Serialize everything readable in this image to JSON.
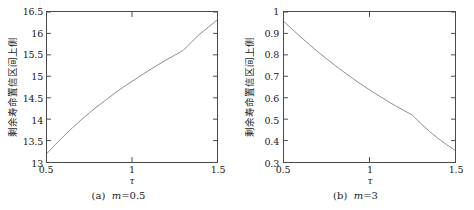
{
  "figure": {
    "panels": [
      {
        "id": "a",
        "caption_index": "(a)",
        "caption_var": "m",
        "caption_eq": "=0.5",
        "ylabel": "剩余寿命置信区间上侧",
        "xlabel": "τ",
        "xticks": [
          "0.5",
          "1",
          "1.5"
        ],
        "yticks": [
          "13",
          "13.5",
          "14",
          "14.5",
          "15",
          "15.5",
          "16",
          "16.5"
        ]
      },
      {
        "id": "b",
        "caption_index": "(b)",
        "caption_var": "m",
        "caption_eq": "=3",
        "ylabel": "剩余寿命置信区间上侧",
        "xlabel": "τ",
        "xticks": [
          "0.5",
          "1",
          "1.5"
        ],
        "yticks": [
          "0.3",
          "0.4",
          "0.5",
          "0.6",
          "0.7",
          "0.8",
          "0.9",
          "1"
        ]
      }
    ]
  },
  "chart_data": [
    {
      "type": "line",
      "title": "(a) m=0.5",
      "xlabel": "τ",
      "ylabel": "剩余寿命置信区间上侧",
      "xlim": [
        0.5,
        1.5
      ],
      "ylim": [
        13,
        16.5
      ],
      "xticks": [
        0.5,
        1,
        1.5
      ],
      "yticks": [
        13,
        13.5,
        14,
        14.5,
        15,
        15.5,
        16,
        16.5
      ],
      "grid": false,
      "legend": null,
      "line_color": "#8c8c8c",
      "series": [
        {
          "name": "upper confidence bound",
          "x": [
            0.5,
            0.55,
            0.6,
            0.65,
            0.7,
            0.75,
            0.8,
            0.85,
            0.9,
            0.95,
            1.0,
            1.05,
            1.1,
            1.15,
            1.2,
            1.25,
            1.3,
            1.35,
            1.4,
            1.45,
            1.5
          ],
          "y": [
            13.2,
            13.41,
            13.61,
            13.8,
            13.98,
            14.15,
            14.31,
            14.46,
            14.61,
            14.75,
            14.88,
            15.01,
            15.14,
            15.26,
            15.38,
            15.49,
            15.6,
            15.8,
            15.99,
            16.15,
            16.31
          ]
        }
      ]
    },
    {
      "type": "line",
      "title": "(b) m=3",
      "xlabel": "τ",
      "ylabel": "剩余寿命置信区间上侧",
      "xlim": [
        0.5,
        1.5
      ],
      "ylim": [
        0.3,
        1.0
      ],
      "xticks": [
        0.5,
        1,
        1.5
      ],
      "yticks": [
        0.3,
        0.4,
        0.5,
        0.6,
        0.7,
        0.8,
        0.9,
        1.0
      ],
      "grid": false,
      "legend": null,
      "line_color": "#8c8c8c",
      "series": [
        {
          "name": "upper confidence bound",
          "x": [
            0.5,
            0.55,
            0.6,
            0.65,
            0.7,
            0.75,
            0.8,
            0.85,
            0.9,
            0.95,
            1.0,
            1.05,
            1.1,
            1.15,
            1.2,
            1.25,
            1.3,
            1.35,
            1.4,
            1.45,
            1.5
          ],
          "y": [
            0.955,
            0.918,
            0.882,
            0.847,
            0.813,
            0.781,
            0.75,
            0.72,
            0.691,
            0.663,
            0.637,
            0.611,
            0.587,
            0.563,
            0.541,
            0.519,
            0.48,
            0.443,
            0.411,
            0.381,
            0.355
          ]
        }
      ]
    }
  ]
}
